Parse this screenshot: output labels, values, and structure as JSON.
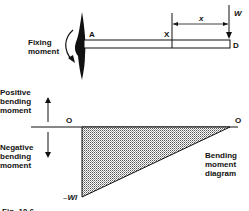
{
  "figure": {
    "beam": {
      "fixing_moment_label_line1": "Fixing",
      "fixing_moment_label_line2": "moment",
      "point_a": "A",
      "point_x": "X",
      "point_d": "D",
      "load_label": "W",
      "distance_label": "x"
    },
    "diagram": {
      "positive_line1": "Positive",
      "positive_line2": "bending",
      "positive_line3": "moment",
      "negative_line1": "Negative",
      "negative_line2": "bending",
      "negative_line3": "moment",
      "origin_left": "O",
      "origin_right": "O",
      "min_value": "–Wl",
      "title_line1": "Bending",
      "title_line2": "moment",
      "title_line3": "diagram"
    },
    "caption": "Fig. 10.6"
  },
  "colors": {
    "ink": "#111111",
    "fill": "#bdbdbd"
  }
}
